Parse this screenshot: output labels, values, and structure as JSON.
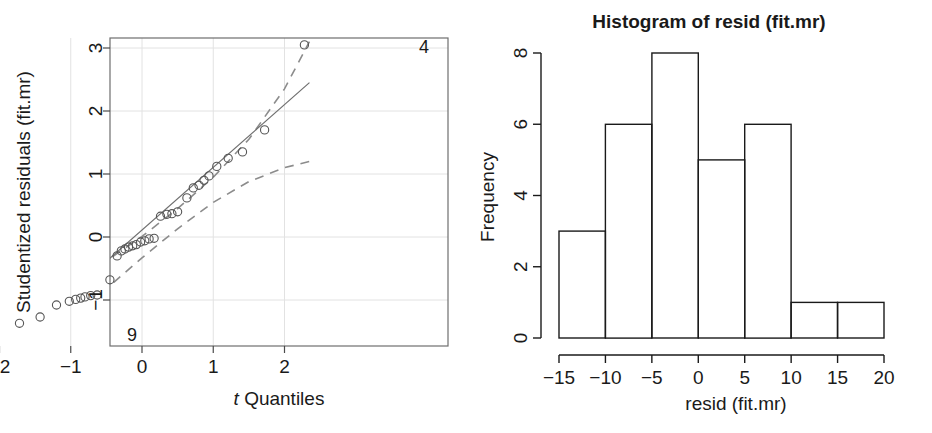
{
  "figure": {
    "width": 932,
    "height": 433,
    "background": "#ffffff",
    "ink": "#1a1a1a",
    "grid_color": "#e2e2e2",
    "band_color": "#808080"
  },
  "panels": {
    "qq": {
      "xlabel_italic": "t",
      "xlabel_rest": " Quantiles",
      "ylabel": "Studentized residuals (fit.mr)",
      "point_label_high": "4",
      "point_label_low": "9"
    },
    "hist": {
      "title": "Histogram of resid (fit.mr)",
      "xlabel": "resid (fit.mr)",
      "ylabel": "Frequency"
    }
  },
  "chart_data": [
    {
      "type": "scatter",
      "name": "qq-plot",
      "title": "",
      "xlabel": "t Quantiles",
      "ylabel": "Studentized residuals (fit.mr)",
      "xlim": [
        -2.45,
        2.45
      ],
      "ylim": [
        -1.85,
        3.3
      ],
      "xticks": [
        -2,
        -1,
        0,
        1,
        2
      ],
      "yticks": [
        -1,
        0,
        1,
        2,
        3
      ],
      "grid": true,
      "legend": "none",
      "annotations": [
        {
          "text": "4",
          "x": 2.15,
          "y": 3.05
        },
        {
          "text": "9",
          "x": -2.1,
          "y": -1.6
        }
      ],
      "reference_line": {
        "style": "solid",
        "x": [
          -1.92,
          2.35
        ],
        "y": [
          -1.8,
          2.45
        ]
      },
      "confidence_band": {
        "style": "dashed",
        "upper_x": [
          -2.45,
          -2.0,
          -1.5,
          -1.0,
          -0.5,
          0.0,
          0.5,
          1.0,
          1.5,
          2.0,
          2.35
        ],
        "upper_y": [
          -1.35,
          -1.19,
          -0.97,
          -0.7,
          -0.38,
          0.01,
          0.45,
          0.95,
          1.55,
          2.35,
          3.1
        ],
        "lower_x": [
          -2.45,
          -2.0,
          -1.5,
          -1.0,
          -0.5,
          0.0,
          0.5,
          1.0,
          1.5,
          2.0,
          2.35
        ],
        "lower_y": [
          -2.7,
          -2.25,
          -1.75,
          -1.3,
          -0.82,
          -0.33,
          0.13,
          0.55,
          0.88,
          1.1,
          1.2
        ]
      },
      "points": [
        {
          "x": -2.22,
          "y": -1.6
        },
        {
          "x": -1.72,
          "y": -1.37
        },
        {
          "x": -1.43,
          "y": -1.27
        },
        {
          "x": -1.2,
          "y": -1.08
        },
        {
          "x": -1.02,
          "y": -1.02
        },
        {
          "x": -0.93,
          "y": -0.99
        },
        {
          "x": -0.86,
          "y": -0.97
        },
        {
          "x": -0.8,
          "y": -0.95
        },
        {
          "x": -0.72,
          "y": -0.93
        },
        {
          "x": -0.63,
          "y": -0.92
        },
        {
          "x": -0.45,
          "y": -0.68
        },
        {
          "x": -0.35,
          "y": -0.3
        },
        {
          "x": -0.29,
          "y": -0.22
        },
        {
          "x": -0.24,
          "y": -0.19
        },
        {
          "x": -0.19,
          "y": -0.16
        },
        {
          "x": -0.13,
          "y": -0.14
        },
        {
          "x": -0.08,
          "y": -0.12
        },
        {
          "x": -0.02,
          "y": -0.08
        },
        {
          "x": 0.04,
          "y": -0.06
        },
        {
          "x": 0.1,
          "y": -0.03
        },
        {
          "x": 0.17,
          "y": -0.02
        },
        {
          "x": 0.26,
          "y": 0.33
        },
        {
          "x": 0.35,
          "y": 0.36
        },
        {
          "x": 0.42,
          "y": 0.37
        },
        {
          "x": 0.5,
          "y": 0.4
        },
        {
          "x": 0.63,
          "y": 0.62
        },
        {
          "x": 0.72,
          "y": 0.78
        },
        {
          "x": 0.8,
          "y": 0.82
        },
        {
          "x": 0.87,
          "y": 0.9
        },
        {
          "x": 0.94,
          "y": 0.97
        },
        {
          "x": 1.05,
          "y": 1.12
        },
        {
          "x": 1.21,
          "y": 1.25
        },
        {
          "x": 1.41,
          "y": 1.35
        },
        {
          "x": 1.72,
          "y": 1.7
        },
        {
          "x": 2.28,
          "y": 3.05
        }
      ]
    },
    {
      "type": "bar",
      "name": "histogram-of-resid",
      "title": "Histogram of resid (fit.mr)",
      "xlabel": "resid (fit.mr)",
      "ylabel": "Frequency",
      "bin_edges": [
        -15,
        -10,
        -5,
        0,
        5,
        10,
        15,
        20
      ],
      "categories": [
        "[-15,-10)",
        "[-10,-5)",
        "[-5,0)",
        "[0,5)",
        "[5,10)",
        "[10,15)",
        "[15,20)"
      ],
      "values": [
        3,
        6,
        8,
        5,
        6,
        1,
        1
      ],
      "xticks": [
        -15,
        -10,
        -5,
        0,
        5,
        10,
        15,
        20
      ],
      "xtick_labels": [
        "−15",
        "−10",
        "−5",
        "0",
        "5",
        "10",
        "15",
        "20"
      ],
      "yticks": [
        0,
        2,
        4,
        6,
        8
      ],
      "ytick_labels": [
        "0",
        "2",
        "4",
        "6",
        "8"
      ],
      "xlim": [
        -15,
        20
      ],
      "ylim": [
        0,
        8
      ],
      "grid": false,
      "legend": "none"
    }
  ],
  "qq_ticks": {
    "x_labels": [
      "−2",
      "−1",
      "0",
      "1",
      "2"
    ],
    "y_labels": [
      "−1",
      "0",
      "1",
      "2",
      "3"
    ]
  }
}
